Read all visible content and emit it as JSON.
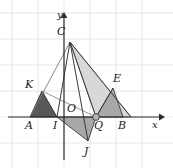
{
  "figure": {
    "background_color": "#ffffff",
    "width": 173,
    "height": 168
  },
  "axes": {
    "x_axis_label": "x",
    "y_axis_label": "y",
    "origin_label": "O",
    "origin_px": [
      64,
      117
    ],
    "x_axis_y_px": 117,
    "y_axis_x_px": 64,
    "x_axis_start_px": [
      8,
      117
    ],
    "x_axis_end_px": [
      163,
      117
    ],
    "y_axis_start_px": [
      64,
      160
    ],
    "y_axis_end_px": [
      64,
      14
    ],
    "axis_color": "#2b2b2b",
    "arrow_style": "filled-triangle"
  },
  "grid": {
    "visible": true,
    "color": "#e3e3e3",
    "spacing_px": 26,
    "x_lines_px": [
      12,
      38,
      64,
      90,
      116,
      142,
      168
    ],
    "y_lines_px": [
      13,
      39,
      65,
      91,
      117,
      143
    ]
  },
  "points": [
    {
      "name": "C",
      "label": "C",
      "px": [
        70,
        42
      ],
      "label_px": [
        57,
        30
      ],
      "marker": false
    },
    {
      "name": "K",
      "label": "K",
      "px": [
        42,
        91
      ],
      "label_px": [
        26,
        80
      ],
      "marker": false
    },
    {
      "name": "E",
      "label": "E",
      "px": [
        113,
        88
      ],
      "label_px": [
        114,
        72
      ],
      "marker": false
    },
    {
      "name": "A",
      "label": "A",
      "px": [
        30,
        117
      ],
      "label_px": [
        24,
        123
      ],
      "marker": false
    },
    {
      "name": "I",
      "label": "I",
      "px": [
        57,
        117
      ],
      "label_px": [
        52,
        123
      ],
      "marker": false
    },
    {
      "name": "O",
      "label": "O",
      "px": [
        64,
        117
      ],
      "label_px": [
        67,
        104
      ],
      "marker": false
    },
    {
      "name": "Q",
      "label": "Q",
      "px": [
        96,
        117
      ],
      "label_px": [
        95,
        123
      ],
      "marker": true
    },
    {
      "name": "B",
      "label": "B",
      "px": [
        123,
        117
      ],
      "label_px": [
        118,
        123
      ],
      "marker": false
    },
    {
      "name": "J",
      "label": "J",
      "px": [
        88,
        141
      ],
      "label_px": [
        85,
        149
      ],
      "marker": false
    }
  ],
  "shapes": [
    {
      "name": "triangle-AIK",
      "vertices": "A,I,K",
      "points_px": "30,117 57,117 42,91",
      "fill": "#585858",
      "stroke": "#3a3a3a",
      "stroke_width": 1
    },
    {
      "name": "triangle-IQJ",
      "vertices": "I,Q,J",
      "points_px": "57,117 96,117 88,141",
      "fill": "#a8a8a8",
      "stroke": "#3a3a3a",
      "stroke_width": 1
    },
    {
      "name": "triangle-QBE",
      "vertices": "Q,B,E",
      "points_px": "96,117 123,117 113,88",
      "fill": "#a8a8a8",
      "stroke": "#3a3a3a",
      "stroke_width": 1
    },
    {
      "name": "triangle-CQE-region",
      "vertices": "C,E,Q",
      "points_px": "70,42 131,117 96,117",
      "fill": "#d8d8d8",
      "stroke": "#6e6e6e",
      "stroke_width": 1
    }
  ],
  "segments": [
    {
      "name": "segment-C-A",
      "from": "C",
      "to": "A",
      "points_px": "70,42 30,117",
      "stroke": "#6e6e6e",
      "stroke_width": 1
    },
    {
      "name": "segment-C-I",
      "from": "C",
      "to": "I",
      "points_px": "70,42 57,117",
      "stroke": "#3a3a3a",
      "stroke_width": 1
    },
    {
      "name": "segment-C-J",
      "from": "C",
      "to": "J",
      "points_px": "70,42 88,141",
      "stroke": "#3a3a3a",
      "stroke_width": 1
    },
    {
      "name": "segment-C-B",
      "from": "C",
      "to": "B",
      "points_px": "70,42 131,117",
      "stroke": "#3a3a3a",
      "stroke_width": 1
    },
    {
      "name": "segment-C-Q",
      "from": "C",
      "to": "Q",
      "points_px": "70,42 96,117",
      "stroke": "#3a3a3a",
      "stroke_width": 1
    },
    {
      "name": "segment-K-Q",
      "from": "K",
      "to": "Q",
      "points_px": "42,91 96,117",
      "stroke": "#6e6e6e",
      "stroke_width": 1
    },
    {
      "name": "segment-A-K",
      "from": "A",
      "to": "K",
      "points_px": "30,117 42,91",
      "stroke": "#3a3a3a",
      "stroke_width": 1
    },
    {
      "name": "segment-Q-E",
      "from": "Q",
      "to": "E",
      "points_px": "96,117 113,88",
      "stroke": "#3a3a3a",
      "stroke_width": 1
    }
  ],
  "marker": {
    "name": "point-marker-Q",
    "px": [
      96,
      117
    ],
    "radius": 3.2,
    "fill": "#b4b4b4",
    "stroke": "#3a3a3a"
  }
}
